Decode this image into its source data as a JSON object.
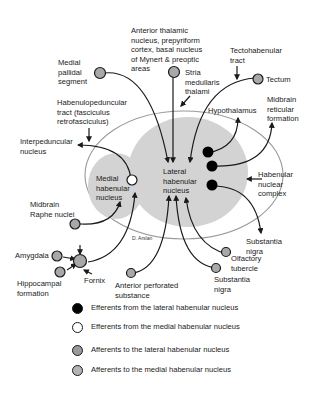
{
  "diagram": {
    "nuclei": {
      "lateral": "Lateral\nhabenular\nnucleus",
      "medial": "Medial\nhabenular\nnucleus",
      "complex": "Habenular\nnuclear\ncomplex"
    },
    "labels": {
      "anterior_thalamic": "Anterior thalamic\nnucleus, prepyriform\ncortex, basal nucleus\nof Mynert & preoptic\nareas",
      "medial_pallidal": "Medial\npallidal\nsegment",
      "stria_medullaris": "Stria\nmedullaris\nthalami",
      "tectohabenular": "Tectohabenular\ntract",
      "tectum": "Tectum",
      "midbrain_reticular": "Midbrain\nreticular\nformation",
      "hypothalamus": "Hypothalamus",
      "habenulopeduncular": "Habenulopeduncular\ntract (fasciculus\nretrofasciculus)",
      "interpeduncular": "Interpeduncular\nnucleus",
      "midbrain_raphe": "Midbrain\nRaphe nuclei",
      "amygdala": "Amygdala",
      "hippocampal": "Hippocampal\nformation",
      "fornix": "Fornix",
      "anterior_perforated": "Anterior perforated\nsubstance",
      "olfactory_tubercle": "Olfactory\ntubercle",
      "substantia_nigra_afferent": "Substantia\nnigra",
      "substantia_nigra_efferent": "Substantia\nnigra"
    },
    "credit": "D. Arslan"
  },
  "legend": {
    "items": [
      {
        "label": "Efferents from the lateral habenular nucleus",
        "fill": "#000000"
      },
      {
        "label": "Efferents from the medial habenular nucleus",
        "fill": "#ffffff"
      },
      {
        "label": "Afferents to the lateral habenular nucleus",
        "fill": "#9a9a9a"
      },
      {
        "label": "Afferents to the medial habenular nucleus",
        "fill": "#b4b4b4"
      }
    ]
  },
  "colors": {
    "nucleus_fill": "#d0d0d0",
    "complex_outline": "#9a9a9a",
    "afferent_node": "#a8a8a8",
    "efferent_lateral_node": "#000000",
    "efferent_medial_node": "#ffffff",
    "line": "#1a1a1a"
  }
}
